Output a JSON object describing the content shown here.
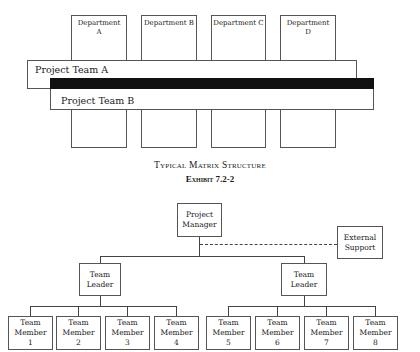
{
  "matrix": {
    "departments": [
      {
        "label_line1": "Department",
        "label_line2": "A"
      },
      {
        "label_line1": "Department B",
        "label_line2": ""
      },
      {
        "label_line1": "Department C",
        "label_line2": ""
      },
      {
        "label_line1": "Department",
        "label_line2": "D"
      }
    ],
    "project_teams": [
      "Project Team A",
      "Project Team B"
    ]
  },
  "captions": {
    "title": "Typical Matrix Structure",
    "exhibit": "Exhibit 7.2-2"
  },
  "org": {
    "manager": {
      "line1": "Project",
      "line2": "Manager"
    },
    "external": {
      "line1": "External",
      "line2": "Support"
    },
    "leaders": [
      {
        "line1": "Team",
        "line2": "Leader"
      },
      {
        "line1": "Team",
        "line2": "Leader"
      }
    ],
    "members": [
      {
        "line1": "Team",
        "line2": "Member",
        "num": "1"
      },
      {
        "line1": "Team",
        "line2": "Member",
        "num": "2"
      },
      {
        "line1": "Team",
        "line2": "Member",
        "num": "3"
      },
      {
        "line1": "Team",
        "line2": "Member",
        "num": "4"
      },
      {
        "line1": "Team",
        "line2": "Member",
        "num": "5"
      },
      {
        "line1": "Team",
        "line2": "Member",
        "num": "6"
      },
      {
        "line1": "Team",
        "line2": "Member",
        "num": "7"
      },
      {
        "line1": "Team",
        "line2": "Member",
        "num": "8"
      }
    ]
  }
}
